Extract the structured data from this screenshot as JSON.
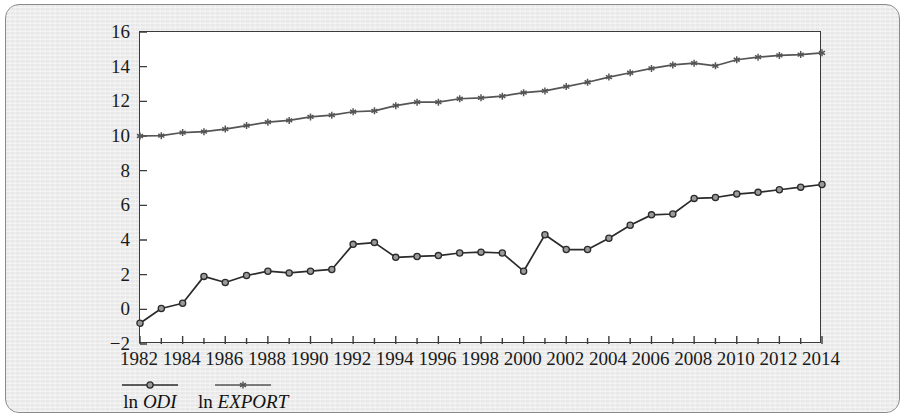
{
  "chart_data": {
    "type": "line",
    "title": "",
    "subtitle": "",
    "xlabel": "",
    "ylabel": "",
    "x": [
      1982,
      1983,
      1984,
      1985,
      1986,
      1987,
      1988,
      1989,
      1990,
      1991,
      1992,
      1993,
      1994,
      1995,
      1996,
      1997,
      1998,
      1999,
      2000,
      2001,
      2002,
      2003,
      2004,
      2005,
      2006,
      2007,
      2008,
      2009,
      2010,
      2011,
      2012,
      2013,
      2014
    ],
    "xlim": [
      1982,
      2014
    ],
    "ylim": [
      -2,
      16
    ],
    "y_ticks": [
      -2,
      0,
      2,
      4,
      6,
      8,
      10,
      12,
      14,
      16
    ],
    "y_tick_labels": [
      "−2",
      "0",
      "2",
      "4",
      "6",
      "8",
      "10",
      "12",
      "14",
      "16"
    ],
    "x_ticks": [
      1982,
      1983,
      1984,
      1985,
      1986,
      1987,
      1988,
      1989,
      1990,
      1991,
      1992,
      1993,
      1994,
      1995,
      1996,
      1997,
      1998,
      1999,
      2000,
      2001,
      2002,
      2003,
      2004,
      2005,
      2006,
      2007,
      2008,
      2009,
      2010,
      2011,
      2012,
      2013,
      2014
    ],
    "x_tick_labels": [
      "1982",
      "1984",
      "1986",
      "1988",
      "1990",
      "1992",
      "1994",
      "1996",
      "1998",
      "2000",
      "2002",
      "2004",
      "2006",
      "2008",
      "2010",
      "2012",
      "2014"
    ],
    "x_tick_label_years": [
      1982,
      1984,
      1986,
      1988,
      1990,
      1992,
      1994,
      1996,
      1998,
      2000,
      2002,
      2004,
      2006,
      2008,
      2010,
      2012,
      2014
    ],
    "grid": false,
    "legend_position": "below-axis-left",
    "series": [
      {
        "name": "ln ODI",
        "label_prefix": "ln",
        "label_italic": "ODI",
        "marker": "circle",
        "color": "#2b2b2b",
        "values": [
          -0.8,
          0.05,
          0.35,
          1.9,
          1.55,
          1.95,
          2.2,
          2.1,
          2.2,
          2.3,
          3.75,
          3.85,
          3.0,
          3.05,
          3.1,
          3.25,
          3.3,
          3.25,
          2.2,
          4.3,
          3.45,
          3.45,
          4.1,
          4.85,
          5.45,
          5.5,
          6.4,
          6.45,
          6.65,
          6.75,
          6.9,
          7.05,
          7.2
        ]
      },
      {
        "name": "ln EXPORT",
        "label_prefix": "ln",
        "label_italic": "EXPORT",
        "marker": "asterisk",
        "color": "#555555",
        "values": [
          10.0,
          10.02,
          10.2,
          10.25,
          10.4,
          10.6,
          10.8,
          10.9,
          11.1,
          11.2,
          11.4,
          11.45,
          11.75,
          11.95,
          11.95,
          12.15,
          12.2,
          12.3,
          12.5,
          12.6,
          12.85,
          13.1,
          13.4,
          13.65,
          13.9,
          14.1,
          14.2,
          14.05,
          14.4,
          14.55,
          14.65,
          14.7,
          14.8
        ]
      }
    ]
  },
  "panel": {
    "background_color": "#ebebeb",
    "border_color": "#8a8a8a",
    "plot_background_color": "#ffffff",
    "axis_color": "#3b3b3b"
  }
}
